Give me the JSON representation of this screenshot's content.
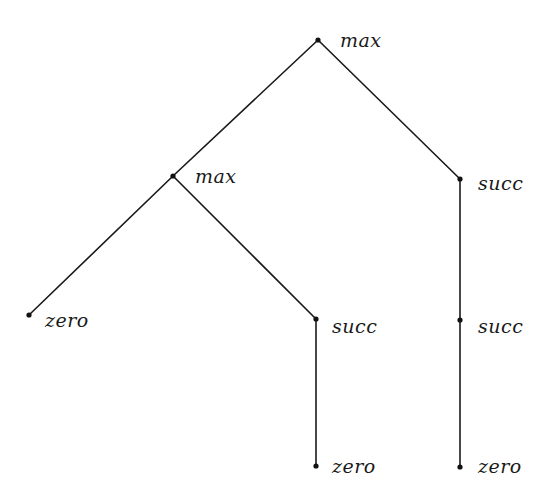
{
  "diagram": {
    "type": "tree",
    "nodes": [
      {
        "id": "n0",
        "label": "max",
        "x": 318,
        "y": 40,
        "label_dx": 22,
        "label_dy": 7
      },
      {
        "id": "n1",
        "label": "max",
        "x": 173,
        "y": 176,
        "label_dx": 22,
        "label_dy": 7
      },
      {
        "id": "n2",
        "label": "succ",
        "x": 460,
        "y": 179,
        "label_dx": 18,
        "label_dy": 11
      },
      {
        "id": "n3",
        "label": "zero",
        "x": 29,
        "y": 315,
        "label_dx": 16,
        "label_dy": 12
      },
      {
        "id": "n4",
        "label": "succ",
        "x": 316,
        "y": 319,
        "label_dx": 16,
        "label_dy": 14
      },
      {
        "id": "n5",
        "label": "succ",
        "x": 460,
        "y": 320,
        "label_dx": 18,
        "label_dy": 13
      },
      {
        "id": "n6",
        "label": "zero",
        "x": 316,
        "y": 466,
        "label_dx": 16,
        "label_dy": 7
      },
      {
        "id": "n7",
        "label": "zero",
        "x": 460,
        "y": 467,
        "label_dx": 18,
        "label_dy": 6
      }
    ],
    "edges": [
      {
        "from": "n0",
        "to": "n1"
      },
      {
        "from": "n0",
        "to": "n2"
      },
      {
        "from": "n1",
        "to": "n3"
      },
      {
        "from": "n1",
        "to": "n4"
      },
      {
        "from": "n4",
        "to": "n6"
      },
      {
        "from": "n2",
        "to": "n5"
      },
      {
        "from": "n5",
        "to": "n7"
      }
    ]
  }
}
